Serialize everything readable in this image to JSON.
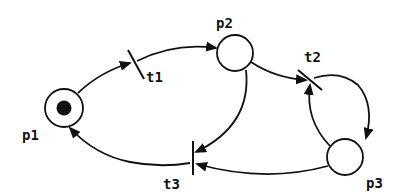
{
  "diagram": {
    "type": "petri-net",
    "places": [
      {
        "id": "p1",
        "label": "p1",
        "tokens": 1
      },
      {
        "id": "p2",
        "label": "p2",
        "tokens": 0
      },
      {
        "id": "p3",
        "label": "p3",
        "tokens": 0
      }
    ],
    "transitions": [
      {
        "id": "t1",
        "label": "t1"
      },
      {
        "id": "t2",
        "label": "t2"
      },
      {
        "id": "t3",
        "label": "t3"
      }
    ],
    "arcs": [
      {
        "from": "p1",
        "to": "t1"
      },
      {
        "from": "t1",
        "to": "p2"
      },
      {
        "from": "p2",
        "to": "t2"
      },
      {
        "from": "t2",
        "to": "p3"
      },
      {
        "from": "p3",
        "to": "t2"
      },
      {
        "from": "p2",
        "to": "t3"
      },
      {
        "from": "p3",
        "to": "t3"
      },
      {
        "from": "t3",
        "to": "p1"
      }
    ],
    "colors": {
      "stroke": "#111111",
      "background": "#ffffff"
    }
  }
}
